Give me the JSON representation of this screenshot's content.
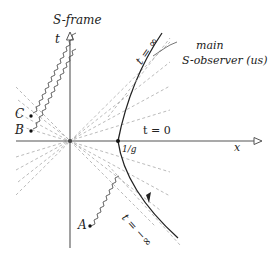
{
  "diagram": {
    "frame_title": "S-frame",
    "axes": {
      "t_label": "t",
      "x_label": "x"
    },
    "labels": {
      "t_inf": "t = ∞",
      "t_zero": "t = 0",
      "t_neg_inf": "t = −∞",
      "one_over_g": "1/g",
      "observer_line1": "main",
      "observer_line2": "S-observer (us)"
    },
    "events": [
      {
        "name": "A",
        "x": 90,
        "y": 226
      },
      {
        "name": "B",
        "x": 30,
        "y": 130
      },
      {
        "name": "C",
        "x": 30,
        "y": 114
      }
    ],
    "origin": {
      "x": 70,
      "y": 141
    },
    "colors": {
      "axis": "#555555",
      "dashed": "#aaaaaa",
      "curve": "#222222",
      "text": "#222222"
    }
  }
}
